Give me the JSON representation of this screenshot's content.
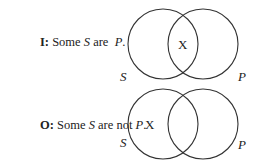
{
  "diagrams": [
    {
      "prefix": "I:",
      "text_before": "Some ",
      "subject": "S",
      "text_middle": " are  ",
      "predicate": "P",
      "text_after": ".",
      "x_mark": "X",
      "x_region": "intersection",
      "circle_labels": {
        "left": "S",
        "right": "P"
      }
    },
    {
      "prefix": "O:",
      "text_before": "Some ",
      "subject": "S",
      "text_middle": " are not ",
      "predicate": "P",
      "text_after": ".",
      "x_mark": "X",
      "x_region": "S-only",
      "circle_labels": {
        "left": "S",
        "right": "P"
      }
    }
  ]
}
